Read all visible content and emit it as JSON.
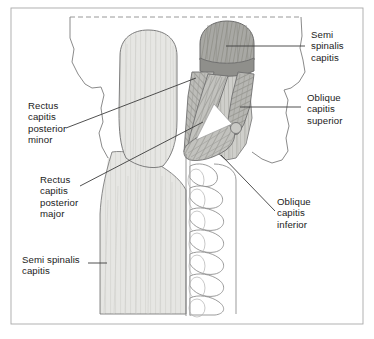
{
  "figure": {
    "frame_color": "#9a9a9a",
    "outline_color": "#7d7d7d",
    "leader_color": "#3c3c3c",
    "text_color": "#1b1b1b"
  },
  "labels": [
    {
      "id": "semispinalis-capitis-top",
      "name": "semispinalis-capitis-upper-label",
      "lines": [
        "Semi",
        "spinalis",
        "capitis"
      ],
      "text": "Semi\nspinalis\ncapitis",
      "position": "top-right",
      "x": 311,
      "y": 29
    },
    {
      "id": "obliquus-capitis-superior",
      "name": "oblique-capitis-superior-label",
      "lines": [
        "Oblique",
        "capitis",
        "superior"
      ],
      "text": "Oblique\ncapitis\nsuperior",
      "position": "middle-right",
      "x": 307,
      "y": 92
    },
    {
      "id": "obliquus-capitis-inferior",
      "name": "oblique-capitis-inferior-label",
      "lines": [
        "Oblique",
        "capitis",
        "inferior"
      ],
      "text": "Oblique\ncapitis\ninferior",
      "position": "lower-right",
      "x": 277,
      "y": 196
    },
    {
      "id": "rectus-capitis-posterior-minor",
      "name": "rectus-capitis-posterior-minor-label",
      "lines": [
        "Rectus",
        "capitis",
        "posterior",
        "minor"
      ],
      "text": "Rectus\ncapitis\nposterior\nminor",
      "position": "middle-left",
      "x": 28,
      "y": 100
    },
    {
      "id": "rectus-capitis-posterior-major",
      "name": "rectus-capitis-posterior-major-label",
      "lines": [
        "Rectus",
        "capitis",
        "posterior",
        "major"
      ],
      "text": "Rectus\ncapitis\nposterior\nmajor",
      "position": "lower-left",
      "x": 40,
      "y": 174
    },
    {
      "id": "semispinalis-capitis-bottom",
      "name": "semispinalis-capitis-lower-label",
      "lines": [
        "Semi spinalis",
        "capitis"
      ],
      "text": "Semi spinalis\ncapitis",
      "position": "bottom-left",
      "x": 22,
      "y": 254
    }
  ],
  "structures": [
    {
      "id": "skull-outline",
      "name": "occipital-skull-outline",
      "fill": "#ffffff",
      "stroke": "#7d7d7d"
    },
    {
      "id": "cut-edge",
      "name": "dashed-cut-edge-line",
      "stroke": "#8c8c8c",
      "style": "dashed"
    },
    {
      "id": "semispinalis-left",
      "name": "semispinalis-capitis-left-belly",
      "fill": "#e3e3e0",
      "stroke": "#7d7d7d"
    },
    {
      "id": "semispinalis-right-cut",
      "name": "semispinalis-capitis-right-cut-stump",
      "fill": "#a9a9a9",
      "stroke": "#6b6b6b"
    },
    {
      "id": "semispinalis-right-body",
      "name": "semispinalis-capitis-right-reflected",
      "fill": "#c9c9c6",
      "stroke": "#7d7d7d"
    },
    {
      "id": "rcpminor",
      "name": "rectus-capitis-posterior-minor-muscle",
      "fill": "#c4c4c1",
      "stroke": "#6f6f6f"
    },
    {
      "id": "rcpmajor",
      "name": "rectus-capitis-posterior-major-muscle",
      "fill": "#b8b8b5",
      "stroke": "#6f6f6f"
    },
    {
      "id": "obliquus-superior",
      "name": "obliquus-capitis-superior-muscle",
      "fill": "#bfbfbc",
      "stroke": "#6f6f6f"
    },
    {
      "id": "obliquus-inferior",
      "name": "obliquus-capitis-inferior-muscle",
      "fill": "#b0b0ad",
      "stroke": "#6f6f6f"
    },
    {
      "id": "suboccipital-triangle",
      "name": "suboccipital-triangle-space",
      "fill": "#ffffff",
      "stroke": "#8a8a8a"
    },
    {
      "id": "cervical-vertebrae",
      "name": "cervical-vertebrae-column",
      "fill": "#ffffff",
      "stroke": "#8a8a8a",
      "count": 8
    },
    {
      "id": "trapezius-band",
      "name": "lower-neck-muscle-band",
      "fill": "#e3e3e0",
      "stroke": "#7d7d7d"
    }
  ]
}
